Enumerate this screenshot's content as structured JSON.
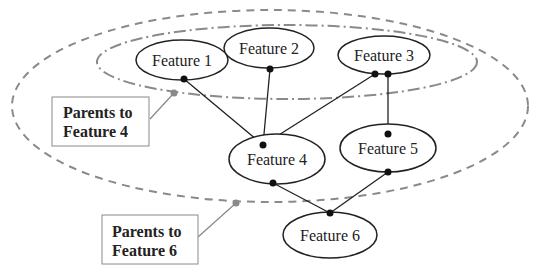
{
  "diagram": {
    "nodes": [
      {
        "id": "f1",
        "label": "Feature 1",
        "cx": 182,
        "cy": 60,
        "rx": 46,
        "ry": 20
      },
      {
        "id": "f2",
        "label": "Feature 2",
        "cx": 269,
        "cy": 48,
        "rx": 45,
        "ry": 20
      },
      {
        "id": "f3",
        "label": "Feature 3",
        "cx": 384,
        "cy": 55,
        "rx": 46,
        "ry": 19
      },
      {
        "id": "f4",
        "label": "Feature 4",
        "cx": 277,
        "cy": 159,
        "rx": 48,
        "ry": 25
      },
      {
        "id": "f5",
        "label": "Feature 5",
        "cx": 388,
        "cy": 148,
        "rx": 48,
        "ry": 24
      },
      {
        "id": "f6",
        "label": "Feature 6",
        "cx": 330,
        "cy": 235,
        "rx": 47,
        "ry": 23
      }
    ],
    "edges": [
      {
        "from": "f1",
        "to": "f4"
      },
      {
        "from": "f2",
        "to": "f4"
      },
      {
        "from": "f3",
        "to": "f4"
      },
      {
        "from": "f3",
        "to": "f5"
      },
      {
        "from": "f4",
        "to": "f6"
      },
      {
        "from": "f5",
        "to": "f6"
      }
    ],
    "groups": [
      {
        "id": "parents-f4",
        "label_line1": "Parents to",
        "label_line2": "Feature 4",
        "style": "dash-dot"
      },
      {
        "id": "parents-f6",
        "label_line1": "Parents to",
        "label_line2": "Feature 6",
        "style": "dashed"
      }
    ],
    "colors": {
      "node_stroke": "#222222",
      "group_stroke": "#8a8a8a",
      "callout_dot": "#8a8a8a"
    }
  }
}
